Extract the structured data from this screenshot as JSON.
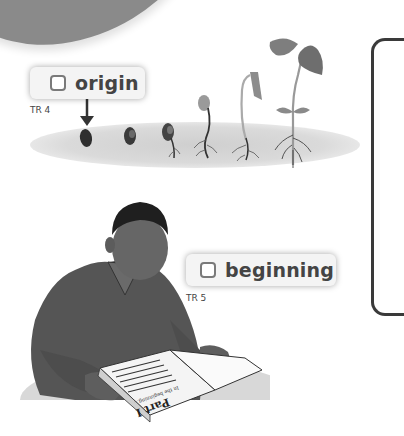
{
  "vocabulary": [
    {
      "word": "origin",
      "checked": false,
      "track": "TR 4",
      "illustration": "bean seed germinating into a seedling, arrow pointing at the seed"
    },
    {
      "word": "beginning",
      "checked": false,
      "track": "TR 5",
      "illustration": "boy reading the first page of a book"
    }
  ],
  "book": {
    "heading": "Part I",
    "subheading": "In the beginning..."
  },
  "icons": {
    "checkbox": "empty-square",
    "arrow": "arrow-down"
  },
  "colors": {
    "banner": "#8a8a8a",
    "box_bg": "#f4f4f4",
    "text": "#444444",
    "frame": "#3a3a3a"
  }
}
